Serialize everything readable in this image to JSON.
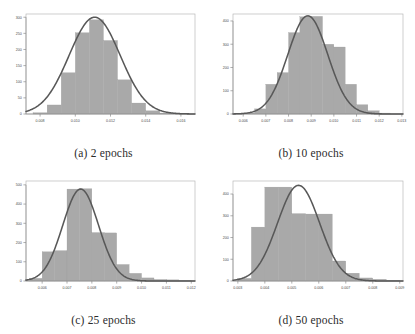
{
  "figure": {
    "background": "#ffffff",
    "bar_color": "#a9a9a9",
    "curve_color": "#585858",
    "panel_count": 4
  },
  "panels": [
    {
      "key": "a",
      "caption": "(a) 2 epochs",
      "chart_data": {
        "type": "bar",
        "title": "(a) 2 epochs",
        "xlabel": "",
        "ylabel": "",
        "grid": false,
        "legend": null,
        "xlim": [
          0.0072,
          0.0168
        ],
        "ylim": [
          0,
          310
        ],
        "xticks": [
          0.008,
          0.01,
          0.012,
          0.014,
          0.016
        ],
        "xtick_labels": [
          "0.008",
          "0.010",
          "0.012",
          "0.014",
          "0.016"
        ],
        "yticks": [
          0,
          50,
          100,
          150,
          200,
          250,
          300
        ],
        "ytick_labels": [
          "0",
          "50",
          "100",
          "150",
          "200",
          "250",
          "300"
        ],
        "bin_edges": [
          0.0076,
          0.0084,
          0.0092,
          0.01,
          0.0108,
          0.0116,
          0.0124,
          0.0132,
          0.014,
          0.0148,
          0.0156,
          0.0164
        ],
        "values": [
          4,
          28,
          128,
          252,
          292,
          228,
          106,
          34,
          10,
          3,
          1
        ],
        "curve": {
          "name": "fitted normal density",
          "mean": 0.0111,
          "sd": 0.00145,
          "peak": 300
        }
      }
    },
    {
      "key": "b",
      "caption": "(b) 10 epochs",
      "chart_data": {
        "type": "bar",
        "title": "(b) 10 epochs",
        "xlabel": "",
        "ylabel": "",
        "grid": false,
        "legend": null,
        "xlim": [
          0.00555,
          0.01305
        ],
        "ylim": [
          0,
          430
        ],
        "xticks": [
          0.006,
          0.007,
          0.008,
          0.009,
          0.01,
          0.011,
          0.012,
          0.013
        ],
        "xtick_labels": [
          "0.006",
          "0.007",
          "0.008",
          "0.009",
          "0.010",
          "0.011",
          "0.012",
          "0.013"
        ],
        "yticks": [
          0,
          100,
          200,
          300,
          400
        ],
        "ytick_labels": [
          "0",
          "100",
          "200",
          "300",
          "400"
        ],
        "bin_edges": [
          0.006,
          0.0065,
          0.007,
          0.0075,
          0.008,
          0.0085,
          0.009,
          0.0095,
          0.01,
          0.0105,
          0.011,
          0.0115,
          0.012,
          0.0125
        ],
        "values": [
          4,
          22,
          128,
          178,
          350,
          418,
          420,
          300,
          288,
          128,
          40,
          14,
          4
        ],
        "curve": {
          "name": "fitted normal density",
          "mean": 0.00885,
          "sd": 0.00088,
          "peak": 422
        }
      }
    },
    {
      "key": "c",
      "caption": "(c) 25 epochs",
      "chart_data": {
        "type": "bar",
        "title": "(c) 25 epochs",
        "xlabel": "",
        "ylabel": "",
        "grid": false,
        "legend": null,
        "xlim": [
          0.00535,
          0.01215
        ],
        "ylim": [
          0,
          520
        ],
        "xticks": [
          0.006,
          0.007,
          0.008,
          0.009,
          0.01,
          0.011,
          0.012
        ],
        "xtick_labels": [
          "0.006",
          "0.007",
          "0.008",
          "0.009",
          "0.010",
          "0.011",
          "0.012"
        ],
        "yticks": [
          0,
          100,
          200,
          300,
          400,
          500
        ],
        "ytick_labels": [
          "0",
          "100",
          "200",
          "300",
          "400",
          "500"
        ],
        "bin_edges": [
          0.0055,
          0.006,
          0.0065,
          0.007,
          0.0075,
          0.008,
          0.0085,
          0.009,
          0.0095,
          0.01,
          0.0105,
          0.011,
          0.0115,
          0.012
        ],
        "values": [
          14,
          152,
          158,
          478,
          480,
          252,
          250,
          86,
          40,
          16,
          8,
          6,
          3
        ],
        "curve": {
          "name": "fitted normal density",
          "mean": 0.00755,
          "sd": 0.00072,
          "peak": 478
        }
      }
    },
    {
      "key": "d",
      "caption": "(d) 50 epochs",
      "chart_data": {
        "type": "bar",
        "title": "(d) 50 epochs",
        "xlabel": "",
        "ylabel": "",
        "grid": false,
        "legend": null,
        "xlim": [
          0.00282,
          0.00912
        ],
        "ylim": [
          0,
          460
        ],
        "xticks": [
          0.003,
          0.004,
          0.005,
          0.006,
          0.007,
          0.008,
          0.009
        ],
        "xtick_labels": [
          "0.003",
          "0.004",
          "0.005",
          "0.006",
          "0.007",
          "0.008",
          "0.009"
        ],
        "yticks": [
          0,
          100,
          200,
          300,
          400
        ],
        "ytick_labels": [
          "0",
          "100",
          "200",
          "300",
          "400"
        ],
        "bin_edges": [
          0.003,
          0.0035,
          0.004,
          0.0045,
          0.005,
          0.0055,
          0.006,
          0.0065,
          0.007,
          0.0075,
          0.008,
          0.0085,
          0.009
        ],
        "values": [
          12,
          248,
          432,
          432,
          310,
          308,
          308,
          92,
          36,
          14,
          8,
          4
        ],
        "curve": {
          "name": "fitted normal density",
          "mean": 0.00525,
          "sd": 0.00078,
          "peak": 440
        }
      }
    }
  ]
}
